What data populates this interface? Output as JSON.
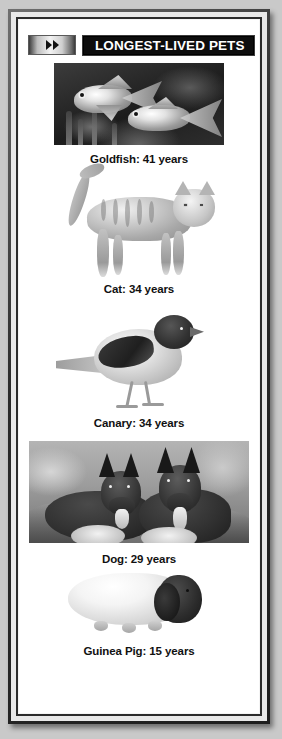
{
  "panel": {
    "header": {
      "ff_icon": "fast-forward-icon",
      "title": "LONGEST-LIVED PETS"
    },
    "pets": [
      {
        "caption": "Goldfish: 41 years",
        "animal": "goldfish",
        "years": 41,
        "image_type": "photo"
      },
      {
        "caption": "Cat: 34 years",
        "animal": "cat",
        "years": 34,
        "image_type": "cutout"
      },
      {
        "caption": "Canary: 34 years",
        "animal": "canary",
        "years": 34,
        "image_type": "cutout"
      },
      {
        "caption": "Dog: 29 years",
        "animal": "dog",
        "years": 29,
        "image_type": "photo"
      },
      {
        "caption": "Guinea Pig: 15 years",
        "animal": "guinea-pig",
        "years": 15,
        "image_type": "cutout"
      }
    ],
    "colors": {
      "page_background": "#c9c9c9",
      "frame_border": "#2b2b2b",
      "panel_background": "#ffffff",
      "title_bar_background": "#0d0d0d",
      "title_text": "#ffffff",
      "caption_text": "#111111"
    }
  }
}
